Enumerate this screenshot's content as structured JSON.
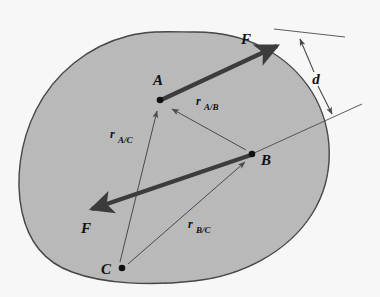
{
  "figure": {
    "type": "engineering-mechanics-free-body-diagram",
    "background_color": "#f7f7f7",
    "body": {
      "name": "rigid-body-blob",
      "fill_color": "#b9b9b9",
      "outline_color": "#3a3a3a"
    },
    "points": [
      {
        "id": "A",
        "label": "A",
        "x": 160,
        "y": 100,
        "label_x": 152,
        "label_y": 84
      },
      {
        "id": "B",
        "label": "B",
        "x": 252,
        "y": 154,
        "label_x": 262,
        "label_y": 163
      },
      {
        "id": "C",
        "label": "C",
        "x": 122,
        "y": 268,
        "label_x": 103,
        "label_y": 273
      }
    ],
    "force_vectors": [
      {
        "id": "F-upper",
        "label": "F",
        "label_x": 243,
        "label_y": 41,
        "x1": 160,
        "y1": 100,
        "x2": 281,
        "y2": 44,
        "color": "#3c3c3c",
        "direction": "up-right"
      },
      {
        "id": "F-lower",
        "label": "F",
        "label_x": 84,
        "label_y": 232,
        "x1": 252,
        "y1": 154,
        "x2": 86,
        "y2": 211,
        "color": "#3c3c3c",
        "direction": "down-left"
      }
    ],
    "position_vectors": [
      {
        "id": "r_A_B",
        "label_main": "r",
        "label_sub": "A/B",
        "label_x": 196,
        "label_y": 109,
        "x1": 246,
        "y1": 150,
        "x2": 171,
        "y2": 108,
        "from": "B",
        "to": "A"
      },
      {
        "id": "r_A_C",
        "label_main": "r",
        "label_sub": "A/C",
        "label_x": 112,
        "label_y": 139,
        "x1": 120,
        "y1": 262,
        "x2": 156,
        "y2": 110,
        "from": "C",
        "to": "A"
      },
      {
        "id": "r_B_C",
        "label_main": "r",
        "label_sub": "B/C",
        "label_x": 188,
        "label_y": 228,
        "x1": 128,
        "y1": 264,
        "x2": 246,
        "y2": 161,
        "from": "C",
        "to": "B"
      }
    ],
    "dimension": {
      "id": "d",
      "label": "d",
      "label_x": 320,
      "label_y": 79,
      "arrow_x1": 299,
      "arrow_y1": 36,
      "arrow_x2": 331,
      "arrow_y2": 116,
      "ext_line_top": {
        "x1": 274,
        "y1": 29,
        "x2": 343,
        "y2": 36
      },
      "ext_line_bottom": {
        "x1": 252,
        "y1": 154,
        "x2": 360,
        "y2": 105
      },
      "color": "#4a4a4a"
    }
  }
}
